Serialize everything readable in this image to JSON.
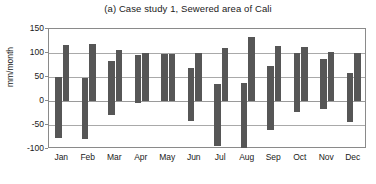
{
  "chart_data": {
    "type": "bar",
    "title": "(a) Case study 1, Sewered area of Cali",
    "xlabel": "",
    "ylabel": "mm/month",
    "ylim": [
      -100,
      150
    ],
    "yticks": [
      150,
      100,
      50,
      0,
      -50,
      -100
    ],
    "ytick_labels": [
      "150",
      "100",
      "50",
      "0",
      "-50",
      "-100"
    ],
    "grid": true,
    "legend": "none",
    "bar_color": "#565656",
    "categories": [
      "Jan",
      "Feb",
      "Mar",
      "Apr",
      "May",
      "Jun",
      "Jul",
      "Aug",
      "Sep",
      "Oct",
      "Nov",
      "Dec"
    ],
    "series": [
      {
        "name": "Series 1",
        "values": [
          50,
          47,
          83,
          95,
          97,
          68,
          35,
          37,
          73,
          100,
          88,
          58
        ]
      },
      {
        "name": "Series 2",
        "values": [
          116,
          118,
          107,
          99,
          97,
          100,
          111,
          133,
          114,
          112,
          103,
          100
        ]
      },
      {
        "name": "Series 3",
        "values": [
          -78,
          -80,
          -30,
          -5,
          0,
          -42,
          -94,
          -98,
          -60,
          -23,
          -16,
          -43
        ]
      }
    ],
    "bars": [
      {
        "category": "Jan",
        "positive": 50,
        "tall": 116,
        "negative": -78
      },
      {
        "category": "Feb",
        "positive": 47,
        "tall": 118,
        "negative": -80
      },
      {
        "category": "Mar",
        "positive": 83,
        "tall": 107,
        "negative": -30
      },
      {
        "category": "Apr",
        "positive": 95,
        "tall": 99,
        "negative": -5
      },
      {
        "category": "May",
        "positive": 97,
        "tall": 97,
        "negative": 0
      },
      {
        "category": "Jun",
        "positive": 68,
        "tall": 100,
        "negative": -42
      },
      {
        "category": "Jul",
        "positive": 35,
        "tall": 111,
        "negative": -94
      },
      {
        "category": "Aug",
        "positive": 37,
        "tall": 133,
        "negative": -98
      },
      {
        "category": "Sep",
        "positive": 73,
        "tall": 114,
        "negative": -60
      },
      {
        "category": "Oct",
        "positive": 100,
        "tall": 112,
        "negative": -23
      },
      {
        "category": "Nov",
        "positive": 88,
        "tall": 103,
        "negative": -16
      },
      {
        "category": "Dec",
        "positive": 58,
        "tall": 100,
        "negative": -43
      }
    ]
  }
}
